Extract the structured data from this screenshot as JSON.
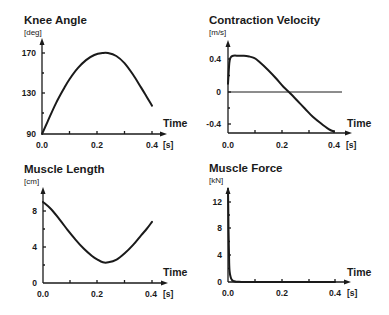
{
  "chart_data": [
    {
      "type": "line",
      "title": "Knee Angle",
      "ylabel": "[deg]",
      "xlabel": "Time",
      "xunit": "[s]",
      "xticks": [
        "0.0",
        "0.2",
        "0.4"
      ],
      "yticks": [
        "90",
        "130",
        "170"
      ],
      "xlim": [
        0,
        0.4
      ],
      "ylim": [
        90,
        170
      ],
      "grid": false,
      "x": [
        0.0,
        0.02,
        0.05,
        0.08,
        0.1,
        0.13,
        0.16,
        0.19,
        0.22,
        0.24,
        0.27,
        0.3,
        0.33,
        0.36,
        0.38,
        0.4
      ],
      "y": [
        90,
        102,
        120,
        135,
        144,
        155,
        163,
        168,
        170,
        170,
        167,
        160,
        149,
        136,
        127,
        118
      ]
    },
    {
      "type": "line",
      "title": "Contraction Velocity",
      "ylabel": "[m/s]",
      "xlabel": "Time",
      "xunit": "[s]",
      "xticks": [
        "0.0",
        "0.2",
        "0.4"
      ],
      "yticks": [
        "-0.4",
        "0",
        "0.4"
      ],
      "xlim": [
        0,
        0.4
      ],
      "ylim": [
        -0.48,
        0.48
      ],
      "grid": false,
      "reference_line": 0,
      "x": [
        0.0,
        0.005,
        0.01,
        0.02,
        0.04,
        0.06,
        0.08,
        0.1,
        0.12,
        0.15,
        0.18,
        0.21,
        0.23,
        0.26,
        0.29,
        0.32,
        0.35,
        0.38,
        0.4
      ],
      "y": [
        0.1,
        0.35,
        0.42,
        0.44,
        0.44,
        0.44,
        0.43,
        0.41,
        0.36,
        0.27,
        0.17,
        0.06,
        0.0,
        -0.1,
        -0.2,
        -0.3,
        -0.38,
        -0.45,
        -0.48
      ]
    },
    {
      "type": "line",
      "title": "Muscle Length",
      "ylabel": "[cm]",
      "xlabel": "Time",
      "xunit": "[s]",
      "xticks": [
        "0.0",
        "0.2",
        "0.4"
      ],
      "yticks": [
        "0",
        "4",
        "8"
      ],
      "xlim": [
        0,
        0.4
      ],
      "ylim": [
        0,
        10
      ],
      "grid": false,
      "x": [
        0.0,
        0.03,
        0.06,
        0.09,
        0.12,
        0.15,
        0.18,
        0.2,
        0.22,
        0.24,
        0.27,
        0.3,
        0.33,
        0.36,
        0.38,
        0.4
      ],
      "y": [
        9.0,
        8.2,
        7.1,
        5.9,
        4.8,
        3.8,
        3.0,
        2.6,
        2.3,
        2.3,
        2.6,
        3.3,
        4.2,
        5.3,
        6.0,
        6.8
      ]
    },
    {
      "type": "line",
      "title": "Muscle Force",
      "ylabel": "[kN]",
      "xlabel": "Time",
      "xunit": "[s]",
      "xticks": [
        "0.0",
        "0.2",
        "0.4"
      ],
      "yticks": [
        "0",
        "4",
        "8",
        "12"
      ],
      "xlim": [
        0,
        0.4
      ],
      "ylim": [
        0,
        14
      ],
      "grid": false,
      "x": [
        0.0,
        0.002,
        0.004,
        0.006,
        0.01,
        0.015,
        0.02,
        0.03,
        0.05,
        0.1,
        0.2,
        0.3,
        0.4
      ],
      "y": [
        14,
        8,
        3.5,
        1.6,
        0.7,
        0.3,
        0.15,
        0.05,
        0.02,
        0.01,
        0.0,
        0.0,
        0.0
      ]
    }
  ],
  "panels": [
    {
      "title": "Knee Angle",
      "unit": "[deg]",
      "time_label": "Time",
      "x_unit": "[s]",
      "xticks": [
        "0.0",
        "0.2",
        "0.4"
      ],
      "yticks": [
        "170",
        "130",
        "90"
      ]
    },
    {
      "title": "Contraction Velocity",
      "unit": "[m/s]",
      "time_label": "Time",
      "x_unit": "[s]",
      "xticks": [
        "0.0",
        "0.2",
        "0.4"
      ],
      "yticks": [
        "0.4",
        "0",
        "-0.4"
      ]
    },
    {
      "title": "Muscle Length",
      "unit": "[cm]",
      "time_label": "Time",
      "x_unit": "[s]",
      "xticks": [
        "0.0",
        "0.2",
        "0.4"
      ],
      "yticks": [
        "8",
        "4",
        "0"
      ]
    },
    {
      "title": "Muscle Force",
      "unit": "[kN]",
      "time_label": "Time",
      "x_unit": "[s]",
      "xticks": [
        "0.0",
        "0.2",
        "0.4"
      ],
      "yticks": [
        "12",
        "8",
        "4",
        "0"
      ]
    }
  ]
}
